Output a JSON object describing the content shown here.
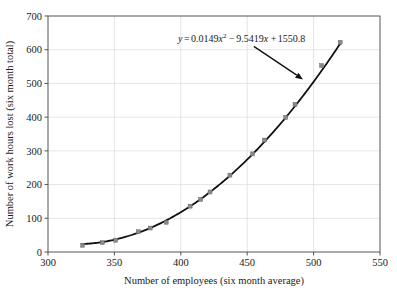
{
  "chart_data": {
    "type": "scatter",
    "title": "",
    "xlabel": "Number of employees (six month average)",
    "ylabel": "Number of work hours lost (six month total)",
    "xlim": [
      300,
      550
    ],
    "ylim": [
      0,
      700
    ],
    "xticks": [
      300,
      350,
      400,
      450,
      500,
      550
    ],
    "yticks": [
      0,
      100,
      200,
      300,
      400,
      500,
      600,
      700
    ],
    "grid": true,
    "legend": "none",
    "annotation": {
      "text": "y = 0.0149x2 - 9.5419x + 1550.8",
      "equation_parts": {
        "lhs": "y",
        "eq": "=",
        "a_term": "0.0149",
        "x_sq_base": "x",
        "x_sq_exp": "2",
        "minus": "−",
        "b_term": "9.5419",
        "x_lin": "x",
        "plus": "+",
        "c_term": "1550.8"
      },
      "arrow_from_data": [
        455,
        610
      ],
      "arrow_to_data": [
        492,
        512
      ]
    },
    "series": [
      {
        "name": "work hours lost vs employees",
        "marker": "square",
        "marker_color": "#8a8a8a",
        "x": [
          326,
          341,
          351,
          368,
          377,
          389,
          407,
          415,
          422,
          437,
          454,
          463,
          479,
          486,
          506,
          520
        ],
        "y": [
          20,
          28,
          35,
          60,
          71,
          88,
          136,
          156,
          178,
          228,
          291,
          332,
          399,
          438,
          553,
          622
        ]
      }
    ],
    "fit_curve": {
      "name": "quadratic regression",
      "color": "#111111",
      "coefficients": {
        "a": 0.0149,
        "b": -9.5419,
        "c": 1550.8
      },
      "x_start": 326,
      "x_end": 520
    },
    "tick_labels": {
      "x": [
        "300",
        "350",
        "400",
        "450",
        "500",
        "550"
      ],
      "y": [
        "0",
        "100",
        "200",
        "300",
        "400",
        "500",
        "600",
        "700"
      ]
    }
  }
}
